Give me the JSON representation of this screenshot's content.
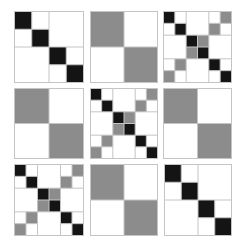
{
  "figure": {
    "colors": {
      "black": "#141414",
      "gray": "#8c8c8c",
      "white": "#ffffff",
      "line": "#c4c4c4"
    },
    "panels": [
      {
        "id": "p1",
        "kind": "block4",
        "x": 14,
        "y": 11,
        "w": 69,
        "h": 71
      },
      {
        "id": "p2",
        "kind": "quad",
        "x": 90,
        "y": 11,
        "w": 67,
        "h": 71
      },
      {
        "id": "p3",
        "kind": "x6",
        "x": 163,
        "y": 11,
        "w": 68,
        "h": 71
      },
      {
        "id": "p4",
        "kind": "quad",
        "x": 14,
        "y": 88,
        "w": 69,
        "h": 70
      },
      {
        "id": "p5",
        "kind": "x6",
        "x": 90,
        "y": 88,
        "w": 67,
        "h": 70
      },
      {
        "id": "p6",
        "kind": "quad",
        "x": 163,
        "y": 88,
        "w": 68,
        "h": 70
      },
      {
        "id": "p7",
        "kind": "x6",
        "x": 14,
        "y": 164,
        "w": 69,
        "h": 71
      },
      {
        "id": "p8",
        "kind": "quad",
        "x": 90,
        "y": 164,
        "w": 67,
        "h": 71
      },
      {
        "id": "p9",
        "kind": "block4",
        "x": 164,
        "y": 164,
        "w": 67,
        "h": 71
      }
    ],
    "patterns": {
      "block4": {
        "n": 4,
        "cells": [
          [
            0,
            0,
            "black"
          ],
          [
            1,
            1,
            "black"
          ],
          [
            2,
            2,
            "black"
          ],
          [
            3,
            3,
            "black"
          ]
        ],
        "lines": {
          "v": [
            [
              2,
              0,
              4
            ],
            [
              1,
              0,
              2
            ],
            [
              3,
              2,
              4
            ]
          ],
          "h": [
            [
              2,
              0,
              4
            ],
            [
              1,
              0,
              2
            ],
            [
              3,
              2,
              4
            ]
          ]
        }
      },
      "quad": {
        "n": 2,
        "cells": [
          [
            0,
            0,
            "gray"
          ],
          [
            1,
            1,
            "gray"
          ]
        ],
        "lines": {
          "v": [
            [
              1,
              0,
              2
            ]
          ],
          "h": [
            [
              1,
              0,
              2
            ]
          ]
        }
      },
      "x6": {
        "n": 6,
        "cells": [
          [
            0,
            0,
            "black"
          ],
          [
            1,
            1,
            "black"
          ],
          [
            2,
            2,
            "black"
          ],
          [
            3,
            3,
            "black"
          ],
          [
            4,
            4,
            "black"
          ],
          [
            5,
            5,
            "black"
          ],
          [
            0,
            5,
            "gray"
          ],
          [
            1,
            4,
            "gray"
          ],
          [
            2,
            3,
            "gray"
          ],
          [
            3,
            2,
            "gray"
          ],
          [
            4,
            1,
            "gray"
          ],
          [
            5,
            0,
            "gray"
          ]
        ],
        "lines": {
          "v": [
            [
              2,
              0,
              6
            ],
            [
              4,
              0,
              6
            ],
            [
              1,
              0,
              2
            ],
            [
              1,
              4,
              6
            ],
            [
              5,
              0,
              2
            ],
            [
              5,
              4,
              6
            ],
            [
              3,
              2,
              4
            ]
          ],
          "h": [
            [
              2,
              0,
              6
            ],
            [
              4,
              0,
              6
            ],
            [
              1,
              0,
              2
            ],
            [
              1,
              4,
              6
            ],
            [
              5,
              0,
              2
            ],
            [
              5,
              4,
              6
            ],
            [
              3,
              2,
              4
            ]
          ]
        }
      }
    }
  }
}
